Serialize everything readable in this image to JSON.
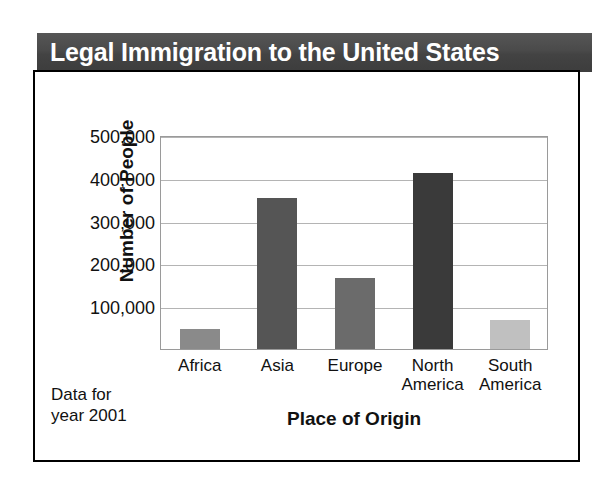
{
  "chart_data": {
    "type": "bar",
    "title": "Legal Immigration to the United States",
    "xlabel": "Place of Origin",
    "ylabel": "Number of People",
    "categories": [
      "Africa",
      "Asia",
      "Europe",
      "North America",
      "South America"
    ],
    "values": [
      47000,
      353000,
      167000,
      412000,
      68000
    ],
    "ylim": [
      0,
      500000
    ],
    "ytick_values": [
      100000,
      200000,
      300000,
      400000,
      500000
    ],
    "ytick_labels": [
      "100,000",
      "200,000",
      "300,000",
      "400,000",
      "500,000"
    ],
    "grid": true,
    "legend": "none",
    "annotation": "Data for year 2001",
    "bar_colors": [
      "#8a8a8a",
      "#555555",
      "#6b6b6b",
      "#3a3a3a",
      "#c0c0c0"
    ]
  },
  "figure": {
    "title_text": "Legal Immigration to the United States",
    "title_bar_color": "#464646",
    "title_text_color": "#ffffff",
    "y_axis_title": "Number of People",
    "x_axis_title": "Place of Origin",
    "footnote_line1": "Data for",
    "footnote_line2": "year 2001",
    "border_color": "#000000",
    "gridline_color": "#b4b4b4"
  },
  "x_labels": [
    {
      "line1": "Africa",
      "line2": ""
    },
    {
      "line1": "Asia",
      "line2": ""
    },
    {
      "line1": "Europe",
      "line2": ""
    },
    {
      "line1": "North",
      "line2": "America"
    },
    {
      "line1": "South",
      "line2": "America"
    }
  ]
}
